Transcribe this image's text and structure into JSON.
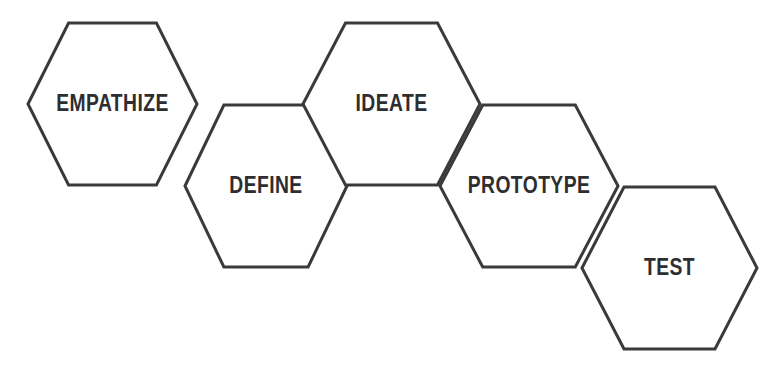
{
  "diagram": {
    "type": "hexagon-chain",
    "stroke_color": "#3a3a3c",
    "fill_color": "#ffffff",
    "text_color": "#2e2e30",
    "stroke_width": 3,
    "stages": [
      {
        "label": "EMPATHIZE",
        "order": 1,
        "cx": 112.5,
        "cy": 104,
        "rx": 84.5,
        "ry": 81,
        "font_size": 23
      },
      {
        "label": "DEFINE",
        "order": 2,
        "cx": 266,
        "cy": 186,
        "rx": 81,
        "ry": 81,
        "font_size": 23
      },
      {
        "label": "IDEATE",
        "order": 3,
        "cx": 391.5,
        "cy": 104,
        "rx": 88.5,
        "ry": 81,
        "font_size": 23
      },
      {
        "label": "PROTOTYPE",
        "order": 4,
        "cx": 529,
        "cy": 186,
        "rx": 89,
        "ry": 81,
        "font_size": 23
      },
      {
        "label": "TEST",
        "order": 5,
        "cx": 669.5,
        "cy": 268,
        "rx": 87.5,
        "ry": 81,
        "font_size": 23
      }
    ]
  }
}
